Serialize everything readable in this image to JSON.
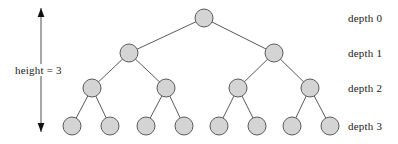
{
  "figure": {
    "kind": "binary-tree-diagram",
    "width": 398,
    "height": 144,
    "background_color": "#ffffff"
  },
  "style": {
    "node_fill": "#d4d4d4",
    "node_stroke": "#5a5a5a",
    "node_radius": 9,
    "edge_color": "#5a5a5a",
    "text_color": "#1a1a1a",
    "arrow_color": "#4d4d4d"
  },
  "height_annotation": {
    "label": "height = 3",
    "arrow_name": "height-double-arrow",
    "arrow_x": 41,
    "arrow_top_y": 8,
    "arrow_bottom_y": 132,
    "label_x": 14,
    "label_y": 64
  },
  "depth_labels": [
    {
      "label": "depth 0",
      "x": 348,
      "y": 12
    },
    {
      "label": "depth 1",
      "x": 348,
      "y": 47
    },
    {
      "label": "depth 2",
      "x": 348,
      "y": 82
    },
    {
      "label": "depth 3",
      "x": 348,
      "y": 120
    }
  ],
  "nodes": [
    {
      "id": "n0",
      "depth": 0,
      "cx": 204,
      "cy": 18
    },
    {
      "id": "n0-0",
      "depth": 1,
      "cx": 129,
      "cy": 53
    },
    {
      "id": "n0-1",
      "depth": 1,
      "cx": 274,
      "cy": 53
    },
    {
      "id": "n0-0-0",
      "depth": 2,
      "cx": 92,
      "cy": 88
    },
    {
      "id": "n0-0-1",
      "depth": 2,
      "cx": 166,
      "cy": 88
    },
    {
      "id": "n0-1-0",
      "depth": 2,
      "cx": 238,
      "cy": 88
    },
    {
      "id": "n0-1-1",
      "depth": 2,
      "cx": 310,
      "cy": 88
    },
    {
      "id": "n0-0-0-0",
      "depth": 3,
      "cx": 72,
      "cy": 126
    },
    {
      "id": "n0-0-0-1",
      "depth": 3,
      "cx": 110,
      "cy": 126
    },
    {
      "id": "n0-0-1-0",
      "depth": 3,
      "cx": 146,
      "cy": 126
    },
    {
      "id": "n0-0-1-1",
      "depth": 3,
      "cx": 184,
      "cy": 126
    },
    {
      "id": "n0-1-0-0",
      "depth": 3,
      "cx": 219,
      "cy": 126
    },
    {
      "id": "n0-1-0-1",
      "depth": 3,
      "cx": 257,
      "cy": 126
    },
    {
      "id": "n0-1-1-0",
      "depth": 3,
      "cx": 292,
      "cy": 126
    },
    {
      "id": "n0-1-1-1",
      "depth": 3,
      "cx": 330,
      "cy": 126
    }
  ],
  "edges": [
    {
      "from": "n0",
      "to": "n0-0"
    },
    {
      "from": "n0",
      "to": "n0-1"
    },
    {
      "from": "n0-0",
      "to": "n0-0-0"
    },
    {
      "from": "n0-0",
      "to": "n0-0-1"
    },
    {
      "from": "n0-1",
      "to": "n0-1-0"
    },
    {
      "from": "n0-1",
      "to": "n0-1-1"
    },
    {
      "from": "n0-0-0",
      "to": "n0-0-0-0"
    },
    {
      "from": "n0-0-0",
      "to": "n0-0-0-1"
    },
    {
      "from": "n0-0-1",
      "to": "n0-0-1-0"
    },
    {
      "from": "n0-0-1",
      "to": "n0-0-1-1"
    },
    {
      "from": "n0-1-0",
      "to": "n0-1-0-0"
    },
    {
      "from": "n0-1-0",
      "to": "n0-1-0-1"
    },
    {
      "from": "n0-1-1",
      "to": "n0-1-1-0"
    },
    {
      "from": "n0-1-1",
      "to": "n0-1-1-1"
    }
  ]
}
